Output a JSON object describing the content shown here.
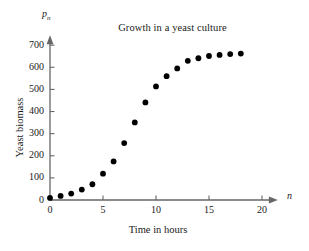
{
  "chart_data": {
    "type": "scatter",
    "title": "Growth in a yeast culture",
    "xlabel": "Time in hours",
    "ylabel": "Yeast biomass",
    "x_axis_variable": "n",
    "y_axis_variable": "p",
    "y_axis_variable_subscript": "n",
    "x": [
      0,
      1,
      2,
      3,
      4,
      5,
      6,
      7,
      8,
      9,
      10,
      11,
      12,
      13,
      14,
      15,
      16,
      17,
      18
    ],
    "values": [
      9.6,
      18.3,
      29.0,
      47.2,
      71.1,
      119.1,
      174.6,
      257.3,
      350.7,
      441.0,
      513.3,
      559.7,
      594.8,
      629.4,
      640.8,
      651.1,
      655.9,
      659.6,
      661.8
    ],
    "xlim": [
      0,
      21.5
    ],
    "ylim": [
      0,
      745
    ],
    "xticks": [
      0,
      5,
      10,
      15,
      20
    ],
    "yticks": [
      0,
      100,
      200,
      300,
      400,
      500,
      600,
      700
    ],
    "xtick_labels": [
      "0",
      "5",
      "10",
      "15",
      "20"
    ],
    "ytick_labels": [
      "0",
      "100",
      "200",
      "300",
      "400",
      "500",
      "600",
      "700"
    ],
    "grid": false,
    "legend": null,
    "marker": "filled-circle",
    "marker_color": "#000000",
    "axis_color": "#666666",
    "background_color": "#ffffff"
  }
}
